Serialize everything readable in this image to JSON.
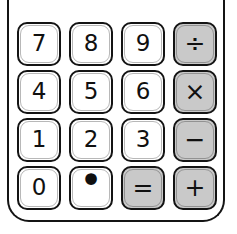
{
  "device": {
    "name": "Calculator keypad",
    "style": "hand-drawn sketch",
    "body_stroke_color": "#141414",
    "body_fill_color": "#ffffff"
  },
  "colors": {
    "number_key_fill": "#ffffff",
    "operator_key_fill": "#c9c9c9",
    "key_stroke": "#141414",
    "label_color": "#101010",
    "page_background": "#ffffff"
  },
  "keypad": {
    "columns": 4,
    "rows": 4,
    "keys": [
      {
        "label": "7",
        "name": "key-7",
        "type": "digit",
        "value": "7",
        "icon": "digit-seven",
        "style": "number"
      },
      {
        "label": "8",
        "name": "key-8",
        "type": "digit",
        "value": "8",
        "icon": "digit-eight",
        "style": "number"
      },
      {
        "label": "9",
        "name": "key-9",
        "type": "digit",
        "value": "9",
        "icon": "digit-nine",
        "style": "number"
      },
      {
        "label": "÷",
        "name": "key-divide",
        "type": "operator",
        "value": "divide",
        "icon": "divide-icon",
        "style": "operator"
      },
      {
        "label": "4",
        "name": "key-4",
        "type": "digit",
        "value": "4",
        "icon": "digit-four",
        "style": "number"
      },
      {
        "label": "5",
        "name": "key-5",
        "type": "digit",
        "value": "5",
        "icon": "digit-five",
        "style": "number"
      },
      {
        "label": "6",
        "name": "key-6",
        "type": "digit",
        "value": "6",
        "icon": "digit-six",
        "style": "number"
      },
      {
        "label": "×",
        "name": "key-multiply",
        "type": "operator",
        "value": "multiply",
        "icon": "multiply-icon",
        "style": "operator"
      },
      {
        "label": "1",
        "name": "key-1",
        "type": "digit",
        "value": "1",
        "icon": "digit-one",
        "style": "number"
      },
      {
        "label": "2",
        "name": "key-2",
        "type": "digit",
        "value": "2",
        "icon": "digit-two",
        "style": "number"
      },
      {
        "label": "3",
        "name": "key-3",
        "type": "digit",
        "value": "3",
        "icon": "digit-three",
        "style": "number"
      },
      {
        "label": "−",
        "name": "key-minus",
        "type": "operator",
        "value": "subtract",
        "icon": "minus-icon",
        "style": "operator"
      },
      {
        "label": "0",
        "name": "key-0",
        "type": "digit",
        "value": "0",
        "icon": "digit-zero",
        "style": "number"
      },
      {
        "label": "•",
        "name": "key-decimal",
        "type": "digit",
        "value": "decimal-point",
        "icon": "decimal-point-icon",
        "style": "number"
      },
      {
        "label": "=",
        "name": "key-equals",
        "type": "operator",
        "value": "equals",
        "icon": "equals-icon",
        "style": "operator"
      },
      {
        "label": "+",
        "name": "key-plus",
        "type": "operator",
        "value": "add",
        "icon": "plus-icon",
        "style": "operator"
      }
    ]
  }
}
